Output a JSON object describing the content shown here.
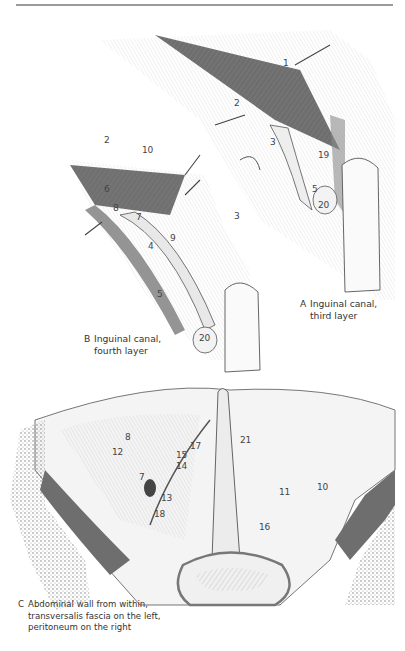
{
  "page": {
    "figures": [
      {
        "id": "A",
        "caption_letter": "A",
        "caption_lines": [
          "Inguinal canal,",
          "third layer"
        ],
        "labels": [
          "1",
          "2",
          "3",
          "19",
          "5",
          "20"
        ]
      },
      {
        "id": "B",
        "caption_letter": "B",
        "caption_lines": [
          "Inguinal canal,",
          "fourth layer"
        ],
        "labels": [
          "2",
          "10",
          "6",
          "8",
          "7",
          "4",
          "9",
          "3",
          "5",
          "20"
        ]
      },
      {
        "id": "C",
        "caption_letter": "C",
        "caption_lines": [
          "Abdominal wall from within,",
          "transversalis fascia on the left,",
          "peritoneum on the right"
        ],
        "labels": [
          "8",
          "17",
          "21",
          "15",
          "14",
          "12",
          "7",
          "13",
          "18",
          "11",
          "10",
          "16"
        ]
      }
    ],
    "colors": {
      "rule": "#9a9a9a",
      "ink": "#333333",
      "muscle": "#6f6f6f",
      "bone": "#c8c8c8"
    }
  }
}
